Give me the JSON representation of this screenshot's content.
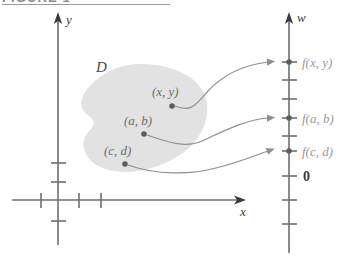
{
  "figure": {
    "caption": "FIGURE 1",
    "colors": {
      "region_fill": "#e2e2e2",
      "axis": "#6e6e6e",
      "arrow_curve": "#8f8f8f",
      "point_dot": "#5d5d5d",
      "value_label": "#9a9a9a",
      "point_label": "#6d6d6d",
      "background": "#ffffff"
    }
  },
  "left_plane": {
    "x_axis_label": "x",
    "y_axis_label": "y",
    "region_label": "D",
    "points": [
      {
        "id": "p-xy",
        "label": "(x, y)"
      },
      {
        "id": "p-ab",
        "label": "(a, b)"
      },
      {
        "id": "p-cd",
        "label": "(c, d)"
      }
    ]
  },
  "right_axis": {
    "axis_label": "w",
    "origin_label": "0",
    "values": [
      {
        "id": "v-fxy",
        "label": "f(x, y)"
      },
      {
        "id": "v-fab",
        "label": "f(a, b)"
      },
      {
        "id": "v-fcd",
        "label": "f(c, d)"
      }
    ]
  }
}
